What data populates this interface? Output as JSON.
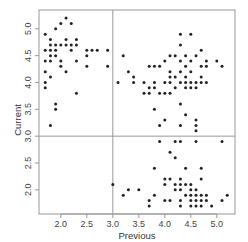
{
  "chart_data": {
    "type": "scatter",
    "title": "",
    "xlabel": "Previous",
    "ylabel": "Current",
    "xlim": [
      1.58,
      5.35
    ],
    "ylim": [
      1.55,
      5.35
    ],
    "xticks": [
      2.0,
      2.5,
      3.0,
      3.5,
      4.0,
      4.5,
      5.0
    ],
    "yticks": [
      2.0,
      2.5,
      3.0,
      3.5,
      4.0,
      4.5,
      5.0
    ],
    "xtick_labels": [
      "2.0",
      "2.5",
      "3.0",
      "3.5",
      "4.0",
      "4.5",
      "5.0"
    ],
    "ytick_labels": [
      "2.0",
      "2.5",
      "3.0",
      "3.5",
      "4.0",
      "4.5",
      "5.0"
    ],
    "grid": false,
    "legend": null,
    "reference_lines": {
      "vertical": 3.0,
      "horizontal": 3.0,
      "color": "#999999"
    },
    "point_color": "#222222",
    "points": [
      [
        1.7,
        4.9
      ],
      [
        1.7,
        4.6
      ],
      [
        1.7,
        4.4
      ],
      [
        1.7,
        4.2
      ],
      [
        1.7,
        4.0
      ],
      [
        1.7,
        3.9
      ],
      [
        1.8,
        4.8
      ],
      [
        1.8,
        4.7
      ],
      [
        1.8,
        4.6
      ],
      [
        1.8,
        4.5
      ],
      [
        1.8,
        4.4
      ],
      [
        1.8,
        4.1
      ],
      [
        1.8,
        3.2
      ],
      [
        1.9,
        5.0
      ],
      [
        1.9,
        4.7
      ],
      [
        1.9,
        4.6
      ],
      [
        1.9,
        4.5
      ],
      [
        1.9,
        3.6
      ],
      [
        1.9,
        3.5
      ],
      [
        2.0,
        5.1
      ],
      [
        2.0,
        4.7
      ],
      [
        2.0,
        4.4
      ],
      [
        2.0,
        4.3
      ],
      [
        2.1,
        5.2
      ],
      [
        2.1,
        4.8
      ],
      [
        2.1,
        4.7
      ],
      [
        2.1,
        4.2
      ],
      [
        2.2,
        5.1
      ],
      [
        2.2,
        4.7
      ],
      [
        2.2,
        4.6
      ],
      [
        2.3,
        4.8
      ],
      [
        2.3,
        4.7
      ],
      [
        2.3,
        4.4
      ],
      [
        2.3,
        3.8
      ],
      [
        2.5,
        4.6
      ],
      [
        2.5,
        4.5
      ],
      [
        2.5,
        4.3
      ],
      [
        2.6,
        4.6
      ],
      [
        2.7,
        4.6
      ],
      [
        2.9,
        4.6
      ],
      [
        2.9,
        4.3
      ],
      [
        3.1,
        4.0
      ],
      [
        3.2,
        4.5
      ],
      [
        3.3,
        4.2
      ],
      [
        3.4,
        4.1
      ],
      [
        3.4,
        4.0
      ],
      [
        3.6,
        3.8
      ],
      [
        3.6,
        4.0
      ],
      [
        3.7,
        4.3
      ],
      [
        3.7,
        3.9
      ],
      [
        3.7,
        3.8
      ],
      [
        3.8,
        4.3
      ],
      [
        3.8,
        3.9
      ],
      [
        3.8,
        4.0
      ],
      [
        3.8,
        3.5
      ],
      [
        3.9,
        4.3
      ],
      [
        3.9,
        3.8
      ],
      [
        3.9,
        3.2
      ],
      [
        4.0,
        4.4
      ],
      [
        4.0,
        4.0
      ],
      [
        4.0,
        3.8
      ],
      [
        4.0,
        3.3
      ],
      [
        4.1,
        4.5
      ],
      [
        4.1,
        4.2
      ],
      [
        4.1,
        4.1
      ],
      [
        4.1,
        4.0
      ],
      [
        4.1,
        3.8
      ],
      [
        4.2,
        4.5
      ],
      [
        4.2,
        4.1
      ],
      [
        4.2,
        3.9
      ],
      [
        4.3,
        4.9
      ],
      [
        4.3,
        4.7
      ],
      [
        4.3,
        4.4
      ],
      [
        4.3,
        4.2
      ],
      [
        4.3,
        4.0
      ],
      [
        4.3,
        3.6
      ],
      [
        4.3,
        3.2
      ],
      [
        4.4,
        4.5
      ],
      [
        4.4,
        4.3
      ],
      [
        4.4,
        4.1
      ],
      [
        4.4,
        4.0
      ],
      [
        4.4,
        3.9
      ],
      [
        4.4,
        3.4
      ],
      [
        4.5,
        4.9
      ],
      [
        4.5,
        4.4
      ],
      [
        4.5,
        4.2
      ],
      [
        4.5,
        4.0
      ],
      [
        4.5,
        3.9
      ],
      [
        4.6,
        4.5
      ],
      [
        4.6,
        4.0
      ],
      [
        4.6,
        3.9
      ],
      [
        4.6,
        3.3
      ],
      [
        4.6,
        3.2
      ],
      [
        4.6,
        3.1
      ],
      [
        4.7,
        4.6
      ],
      [
        4.7,
        4.3
      ],
      [
        4.7,
        4.1
      ],
      [
        4.7,
        4.0
      ],
      [
        4.8,
        4.4
      ],
      [
        4.8,
        4.3
      ],
      [
        4.8,
        4.0
      ],
      [
        5.0,
        4.4
      ],
      [
        5.1,
        4.3
      ],
      [
        3.0,
        2.1
      ],
      [
        3.2,
        1.9
      ],
      [
        3.3,
        2.0
      ],
      [
        3.5,
        2.0
      ],
      [
        3.7,
        1.8
      ],
      [
        3.7,
        1.7
      ],
      [
        3.8,
        1.9
      ],
      [
        3.8,
        2.4
      ],
      [
        3.9,
        2.9
      ],
      [
        4.0,
        2.2
      ],
      [
        4.0,
        2.1
      ],
      [
        4.0,
        1.8
      ],
      [
        4.1,
        2.7
      ],
      [
        4.1,
        2.2
      ],
      [
        4.1,
        1.8
      ],
      [
        4.2,
        2.9
      ],
      [
        4.2,
        2.6
      ],
      [
        4.2,
        2.1
      ],
      [
        4.2,
        2.0
      ],
      [
        4.3,
        2.9
      ],
      [
        4.3,
        2.2
      ],
      [
        4.3,
        2.1
      ],
      [
        4.3,
        2.0
      ],
      [
        4.3,
        1.8
      ],
      [
        4.3,
        1.7
      ],
      [
        4.4,
        2.4
      ],
      [
        4.4,
        2.1
      ],
      [
        4.4,
        1.9
      ],
      [
        4.5,
        2.1
      ],
      [
        4.5,
        2.0
      ],
      [
        4.5,
        1.9
      ],
      [
        4.5,
        1.8
      ],
      [
        4.5,
        1.7
      ],
      [
        4.6,
        2.9
      ],
      [
        4.6,
        2.0
      ],
      [
        4.6,
        1.9
      ],
      [
        4.6,
        1.8
      ],
      [
        4.6,
        1.7
      ],
      [
        4.7,
        2.4
      ],
      [
        4.7,
        2.2
      ],
      [
        4.7,
        1.9
      ],
      [
        4.7,
        1.8
      ],
      [
        4.7,
        1.7
      ],
      [
        4.8,
        1.9
      ],
      [
        4.8,
        1.8
      ],
      [
        4.9,
        1.7
      ],
      [
        5.1,
        2.9
      ],
      [
        5.1,
        1.8
      ],
      [
        5.2,
        1.9
      ]
    ]
  }
}
